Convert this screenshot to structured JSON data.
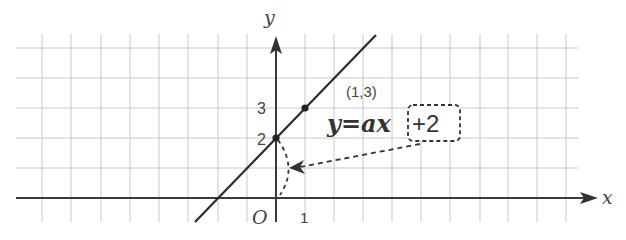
{
  "diagram": {
    "type": "coordinate-graph",
    "axes": {
      "x_label": "x",
      "y_label": "y",
      "origin_label": "O"
    },
    "ticks": {
      "x_one": "1",
      "y_two": "2",
      "y_three": "3"
    },
    "point_label": "(1,3)",
    "equation": {
      "main": "y=ax",
      "highlight": "+2"
    },
    "line": {
      "slope": 1,
      "intercept": 2,
      "points": [
        [
          0,
          2
        ],
        [
          1,
          3
        ]
      ]
    },
    "colors": {
      "axis": "#3a3a3a",
      "line": "#2b2b2b",
      "grid": "#c8c8c8",
      "dashed": "#3a3a3a",
      "text": "#333333"
    }
  }
}
